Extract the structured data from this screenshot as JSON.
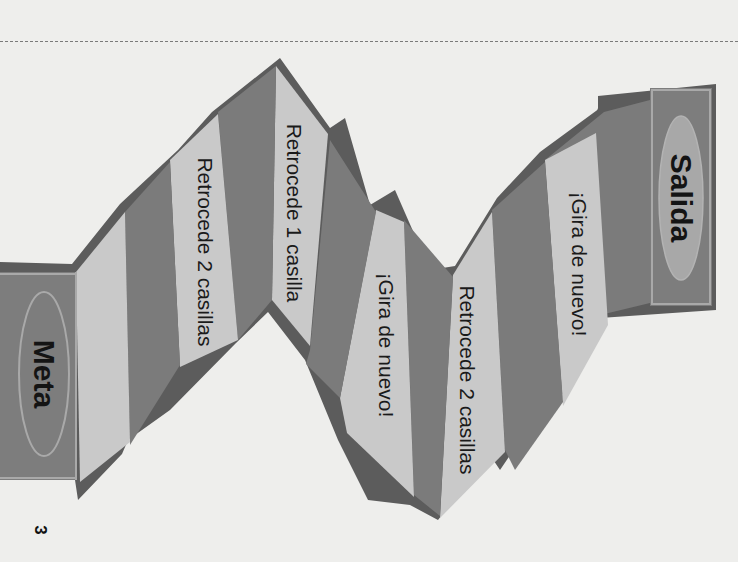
{
  "board": {
    "start_label": "Salida",
    "finish_label": "Meta",
    "page_number": "3",
    "colors": {
      "background": "#eeeeec",
      "outline": "#5c5c5c",
      "dark_square": "#7b7b7b",
      "light_square": "#c9c9c9",
      "end_block": "#7d7d7d",
      "end_oval": "#a8a8a8",
      "end_inner_border": "#a9a9a9"
    },
    "squares": [
      {
        "index": 1,
        "shade": "dark",
        "label": ""
      },
      {
        "index": 2,
        "shade": "light",
        "label": "¡Gira de nuevo!"
      },
      {
        "index": 3,
        "shade": "dark",
        "label": ""
      },
      {
        "index": 4,
        "shade": "light",
        "label": "Retrocede 2 casillas"
      },
      {
        "index": 5,
        "shade": "dark",
        "label": ""
      },
      {
        "index": 6,
        "shade": "light",
        "label": "¡Gira de nuevo!"
      },
      {
        "index": 7,
        "shade": "dark",
        "label": ""
      },
      {
        "index": 8,
        "shade": "light",
        "label": "Retrocede 1 casilla"
      },
      {
        "index": 9,
        "shade": "dark",
        "label": ""
      },
      {
        "index": 10,
        "shade": "light",
        "label": "Retrocede 2 casillas"
      },
      {
        "index": 11,
        "shade": "dark",
        "label": ""
      },
      {
        "index": 12,
        "shade": "light",
        "label": ""
      }
    ]
  }
}
